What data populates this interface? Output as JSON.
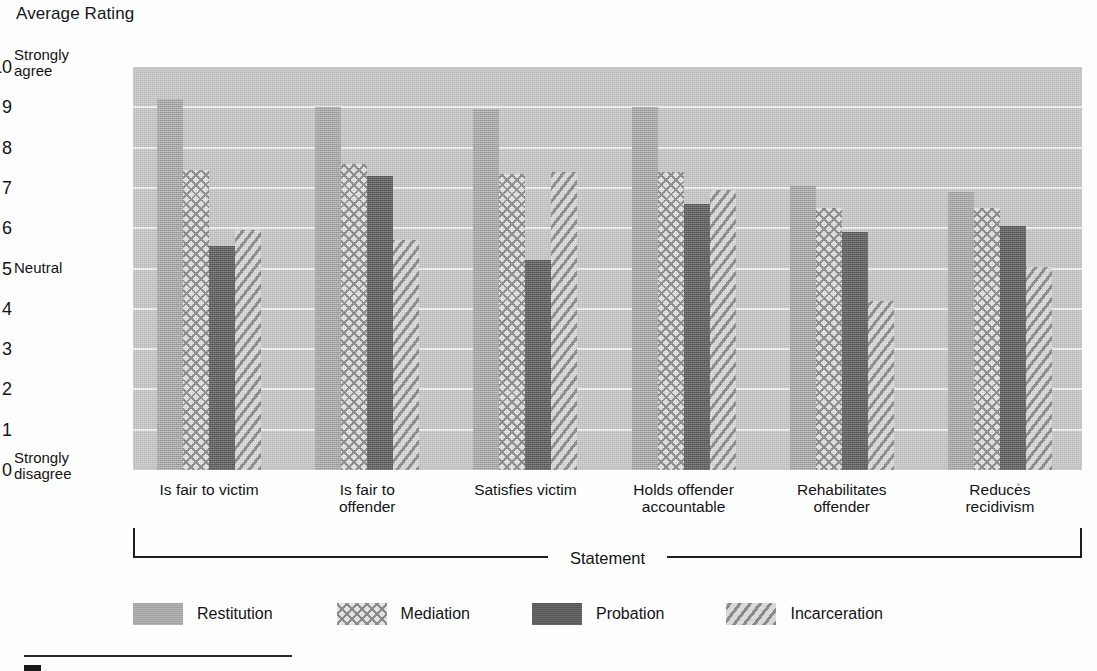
{
  "chart_data": {
    "type": "bar",
    "title": "Average Rating",
    "xlabel": "Statement",
    "ylabel": "Average Rating",
    "ylim": [
      0,
      10
    ],
    "ytick_labels": [
      "0",
      "1",
      "2",
      "3",
      "4",
      "5",
      "6",
      "7",
      "8",
      "9",
      "10"
    ],
    "y_anchor_labels": {
      "top": "Strongly\nagree",
      "middle": "Neutral",
      "bottom": "Strongly\ndisagree"
    },
    "y_anchor_top_line1": "Strongly",
    "y_anchor_top_line2": "agree",
    "y_anchor_mid": "Neutral",
    "y_anchor_bottom_line1": "Strongly",
    "y_anchor_bottom_line2": "disagree",
    "grid": true,
    "legend_position": "bottom",
    "categories": [
      "Is fair to victim",
      "Is fair to offender",
      "Satisfies victim",
      "Holds offender accountable",
      "Rehabilitates offender",
      "Reduces recidivism"
    ],
    "category_lines": [
      [
        "Is fair to victim"
      ],
      [
        "Is fair to",
        "offender"
      ],
      [
        "Satisfies victim"
      ],
      [
        "Holds offender",
        "accountable"
      ],
      [
        "Rehabilitates",
        "offender"
      ],
      [
        "Reduces",
        "recidivism"
      ]
    ],
    "series": [
      {
        "name": "Restitution",
        "fill": "#aaaaaa",
        "pattern": "solid-light-gray",
        "values": [
          9.2,
          9.0,
          8.95,
          9.0,
          7.05,
          6.9
        ]
      },
      {
        "name": "Mediation",
        "fill": "#e2e2e2",
        "pattern": "crosshatch",
        "values": [
          7.45,
          7.6,
          7.35,
          7.4,
          6.5,
          6.5
        ]
      },
      {
        "name": "Probation",
        "fill": "#5e5e5e",
        "pattern": "solid-dark-gray",
        "values": [
          5.55,
          7.3,
          5.2,
          6.6,
          5.9,
          6.05
        ]
      },
      {
        "name": "Incarceration",
        "fill": "#d6d6d6",
        "pattern": "diagonal-stripes",
        "values": [
          5.95,
          5.7,
          7.4,
          6.95,
          4.2,
          5.05
        ]
      }
    ]
  }
}
